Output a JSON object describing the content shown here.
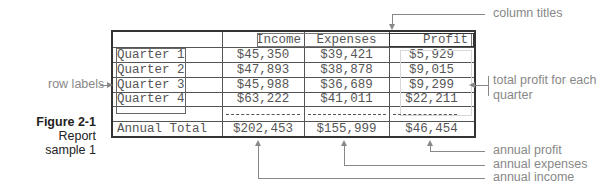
{
  "figure": {
    "number": "Figure 2-1",
    "caption": "Report sample 1"
  },
  "table": {
    "columns": [
      "Income",
      "Expenses",
      "Profit"
    ],
    "rows": [
      {
        "label": "Quarter 1",
        "income": "$45,350",
        "expenses": "$39,421",
        "profit": "$5,929"
      },
      {
        "label": "Quarter 2",
        "income": "$47,893",
        "expenses": "$38,878",
        "profit": "$9,015"
      },
      {
        "label": "Quarter 3",
        "income": "$45,988",
        "expenses": "$36,689",
        "profit": "$9,299"
      },
      {
        "label": "Quarter 4",
        "income": "$63,222",
        "expenses": "$41,011",
        "profit": "$22,211"
      }
    ],
    "total": {
      "label": "Annual Total",
      "income": "$202,453",
      "expenses": "$155,999",
      "profit": "$46,454"
    }
  },
  "annotations": {
    "column_titles": "column titles",
    "row_labels": "row labels",
    "total_profit_line1": "total profit for each",
    "total_profit_line2": "quarter",
    "annual_profit": "annual profit",
    "annual_expenses": "annual expenses",
    "annual_income": "annual income"
  }
}
